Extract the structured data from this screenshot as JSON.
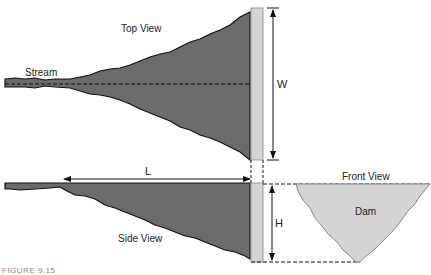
{
  "figure": {
    "caption": "FIGURE 9.15",
    "labels": {
      "top_view": "Top View",
      "stream": "Stream",
      "side_view": "Side View",
      "front_view": "Front View",
      "dam": "Dam",
      "width": "W",
      "length": "L",
      "height": "H"
    },
    "colors": {
      "water": "#6b6b6b",
      "dam": "#d4d4d4",
      "outline": "#111111"
    }
  }
}
